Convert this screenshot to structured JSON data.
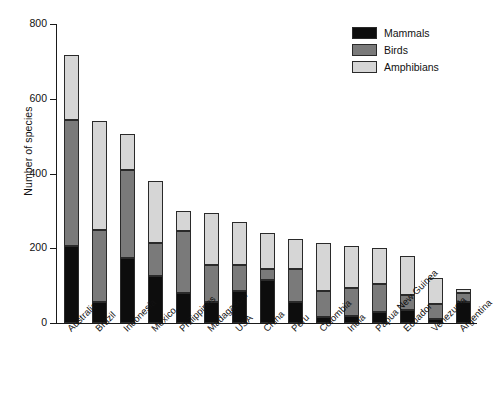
{
  "chart_data": {
    "type": "bar",
    "stacked": true,
    "title": "",
    "xlabel": "",
    "ylabel": "Number of species",
    "ylim": [
      0,
      800
    ],
    "yticks": [
      0,
      200,
      400,
      600,
      800
    ],
    "grid": false,
    "legend_position": "top-right",
    "categories": [
      "Australia",
      "Brazil",
      "Indonesia",
      "Mexico",
      "Philippines",
      "Madagascar",
      "USA",
      "China",
      "Peru",
      "Colombia",
      "India",
      "Papua New Guinea",
      "Ecuador",
      "Venezuela",
      "Argentina"
    ],
    "series": [
      {
        "name": "Mammals",
        "color": "#0d0d0d",
        "values": [
          207,
          55,
          175,
          125,
          80,
          55,
          85,
          115,
          55,
          15,
          20,
          30,
          35,
          10,
          55
        ]
      },
      {
        "name": "Birds",
        "color": "#7a7a7a",
        "values": [
          336,
          195,
          235,
          90,
          165,
          100,
          70,
          30,
          90,
          70,
          75,
          75,
          40,
          40,
          25
        ]
      },
      {
        "name": "Amphibians",
        "color": "#d6d6d6",
        "values": [
          175,
          290,
          95,
          165,
          55,
          140,
          115,
          95,
          80,
          130,
          110,
          95,
          105,
          70,
          10
        ]
      }
    ],
    "totals": [
      718,
      540,
      505,
      380,
      300,
      295,
      270,
      240,
      225,
      215,
      205,
      200,
      180,
      120,
      90
    ]
  },
  "legend": {
    "items": [
      {
        "label": "Mammals",
        "color": "#0d0d0d"
      },
      {
        "label": "Birds",
        "color": "#7a7a7a"
      },
      {
        "label": "Amphibians",
        "color": "#d6d6d6"
      }
    ]
  },
  "axes": {
    "y_title": "Number of species",
    "y_tick_labels": [
      "0",
      "200",
      "400",
      "600",
      "800"
    ]
  }
}
